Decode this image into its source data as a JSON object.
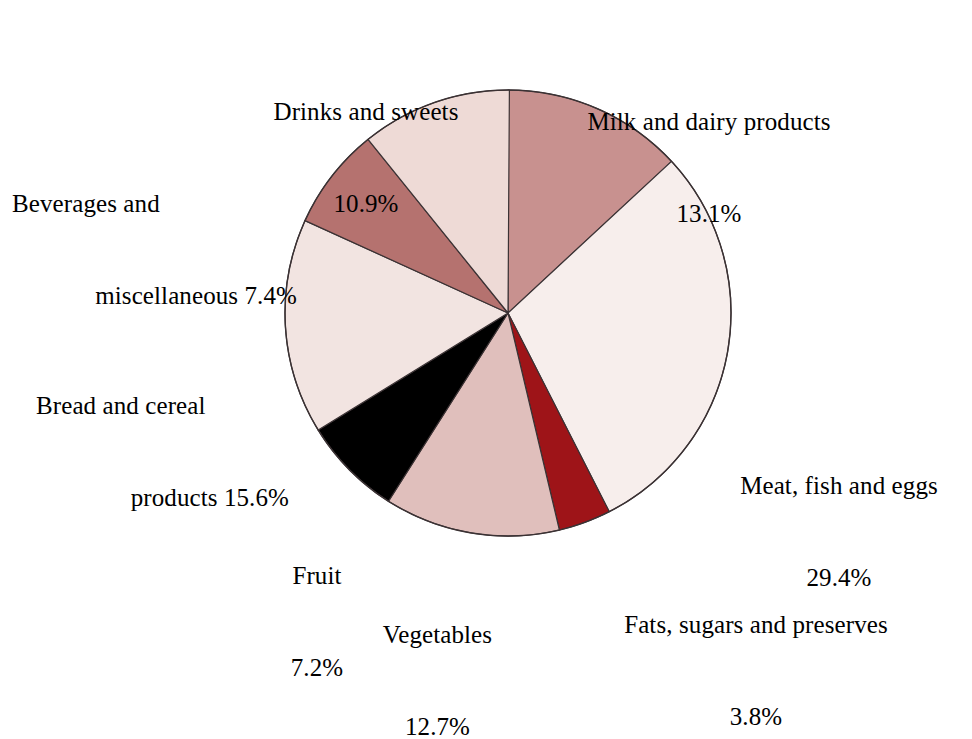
{
  "chart_data": {
    "type": "pie",
    "title": "",
    "subtitle": "",
    "xlabel": "",
    "ylabel": "",
    "legend_position": "none",
    "grid": false,
    "units": "percent",
    "start_angle_deg": -90,
    "direction": "clockwise",
    "center_px": [
      508,
      313
    ],
    "radius_px": 223,
    "outline_color": "#3b3234",
    "background": "#ffffff",
    "categories": [
      "Milk and dairy products",
      "Meat, fish and eggs",
      "Fats, sugars and preserves",
      "Vegetables",
      "Fruit",
      "Bread and cereal products",
      "Beverages and miscellaneous",
      "Drinks and sweets"
    ],
    "values": [
      13.1,
      29.4,
      3.8,
      12.7,
      7.2,
      15.6,
      7.4,
      10.9
    ],
    "colors": [
      "#c8918f",
      "#f7eeec",
      "#9e1418",
      "#e0bfbc",
      "#000000",
      "#f2e4e1",
      "#b5726f",
      "#eedad6"
    ],
    "slices": [
      {
        "name": "Milk and dairy products",
        "value": 13.1,
        "display": "13.1%",
        "color": "#c8918f",
        "start_deg": -90.0,
        "sweep_deg": 47.16
      },
      {
        "name": "Meat, fish and eggs",
        "value": 29.4,
        "display": "29.4%",
        "color": "#f7eeec",
        "start_deg": -42.84,
        "sweep_deg": 105.84
      },
      {
        "name": "Fats, sugars and preserves",
        "value": 3.8,
        "display": "3.8%",
        "color": "#9e1418",
        "start_deg": 63.0,
        "sweep_deg": 13.68
      },
      {
        "name": "Vegetables",
        "value": 12.7,
        "display": "12.7%",
        "color": "#e0bfbc",
        "start_deg": 76.68,
        "sweep_deg": 45.72
      },
      {
        "name": "Fruit",
        "value": 7.2,
        "display": "7.2%",
        "color": "#000000",
        "start_deg": 122.4,
        "sweep_deg": 25.92
      },
      {
        "name": "Bread and cereal products",
        "value": 15.6,
        "display": "15.6%",
        "color": "#f2e4e1",
        "start_deg": 148.32,
        "sweep_deg": 56.16
      },
      {
        "name": "Beverages and miscellaneous",
        "value": 7.4,
        "display": "7.4%",
        "color": "#b5726f",
        "start_deg": 204.48,
        "sweep_deg": 26.64
      },
      {
        "name": "Drinks and sweets",
        "value": 10.9,
        "display": "10.9%",
        "color": "#eedad6",
        "start_deg": 231.12,
        "sweep_deg": 39.24
      }
    ]
  },
  "labels": {
    "drinks_and_sweets": {
      "line1": "Drinks and sweets",
      "line2": "10.9%"
    },
    "milk_and_dairy": {
      "line1": "Milk and dairy products",
      "line2": "13.1%"
    },
    "beverages_and_misc": {
      "line1": "Beverages and",
      "line2": "miscellaneous 7.4%"
    },
    "bread_and_cereal": {
      "line1": "Bread and cereal",
      "line2": "products 15.6%"
    },
    "meat_fish_eggs": {
      "line1": "Meat, fish and eggs",
      "line2": "29.4%"
    },
    "fruit": {
      "line1": "Fruit",
      "line2": "7.2%"
    },
    "vegetables": {
      "line1": "Vegetables",
      "line2": "12.7%"
    },
    "fats_sugars_preserves": {
      "line1": "Fats, sugars and preserves",
      "line2": "3.8%"
    }
  }
}
